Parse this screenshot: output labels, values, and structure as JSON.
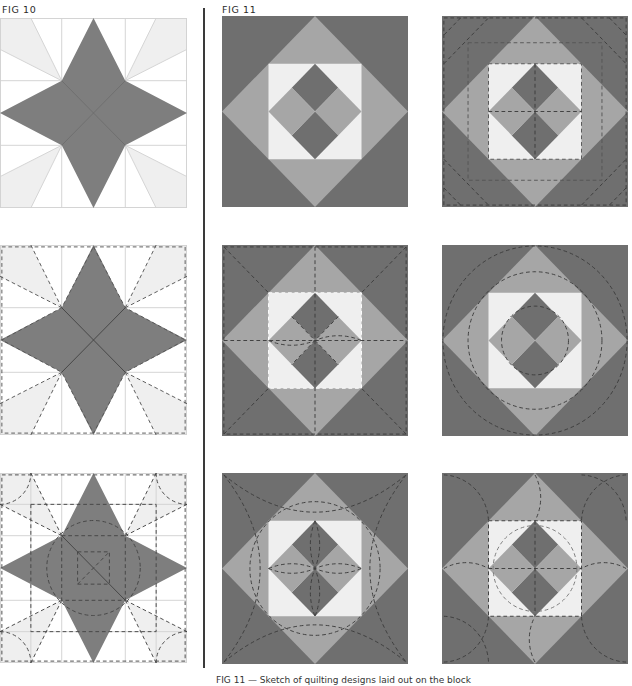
{
  "figures": {
    "fig10": {
      "label": "FIG 10",
      "description": "Four-pointed star block on a 4x4 grid, three quilting variations",
      "blocks": [
        {
          "id": "star-plain",
          "quilting": "none"
        },
        {
          "id": "star-dashed-outline",
          "quilting": "in-the-ditch dashed lines along seams"
        },
        {
          "id": "star-circles",
          "quilting": "dashed circles, squares and arcs"
        }
      ]
    },
    "fig11": {
      "label": "FIG 11",
      "description": "Square-in-a-square block with center four-patch diamond, six quilting variations",
      "blocks": [
        {
          "id": "sq-plain",
          "quilting": "none"
        },
        {
          "id": "sq-diagonal",
          "quilting": "dashed diagonal lines and inner square"
        },
        {
          "id": "sq-cross",
          "quilting": "dashed cross and diagonals"
        },
        {
          "id": "sq-circles",
          "quilting": "concentric dashed circles"
        },
        {
          "id": "sq-arcs",
          "quilting": "dashed corner arcs and circle"
        },
        {
          "id": "sq-petals",
          "quilting": "dashed arcs and inner square"
        }
      ]
    }
  },
  "colors": {
    "star_fill": "#7e7e7e",
    "light_wedge": "#efefef",
    "grid_line": "#cfcfcf",
    "dark_corner": "#6f6f6f",
    "mid_gray": "#a6a6a6",
    "light_center": "#efefef",
    "dashed_line": "#3c3c3c"
  },
  "caption": {
    "text": "FIG 11 — Sketch of quilting designs laid out on the block"
  }
}
